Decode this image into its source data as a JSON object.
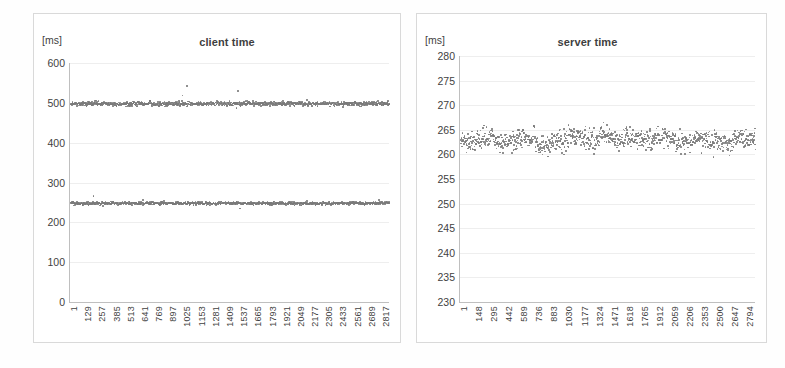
{
  "page": {
    "background": "#fefefe",
    "marker_color": "#808080",
    "gridline_color": "#eeeeee",
    "axis_color": "#bfbfbf",
    "panel_border_color": "#d9d9d9"
  },
  "chart_data": [
    {
      "type": "scatter",
      "name": "client-time-chart",
      "title": "client time",
      "ylabel": "[ms]",
      "xlabel": "",
      "ylim": [
        0,
        600
      ],
      "yticks": [
        0,
        100,
        200,
        300,
        400,
        500,
        600
      ],
      "xlim": [
        1,
        2880
      ],
      "xticks": [
        1,
        129,
        257,
        385,
        513,
        641,
        769,
        897,
        1025,
        1153,
        1281,
        1409,
        1537,
        1665,
        1793,
        1921,
        2049,
        2177,
        2305,
        2433,
        2561,
        2689,
        2817
      ],
      "grid": true,
      "legend": "none",
      "series": [
        {
          "name": "upper-band",
          "mean": 500,
          "noise": 6,
          "outlier_fraction": 0.012,
          "outlier_spread": 22,
          "n": 2880
        },
        {
          "name": "lower-band",
          "mean": 250,
          "noise": 4,
          "outlier_fraction": 0.008,
          "outlier_spread": 16,
          "n": 2880
        }
      ]
    },
    {
      "type": "scatter",
      "name": "server-time-chart",
      "title": "server time",
      "ylabel": "[ms]",
      "xlabel": "",
      "ylim": [
        230,
        280
      ],
      "yticks": [
        230,
        235,
        240,
        245,
        250,
        255,
        260,
        265,
        270,
        275,
        280
      ],
      "xlim": [
        1,
        2880
      ],
      "xticks": [
        1,
        148,
        295,
        442,
        589,
        736,
        883,
        1030,
        1177,
        1324,
        1471,
        1618,
        1765,
        1912,
        2059,
        2206,
        2353,
        2500,
        2647,
        2794
      ],
      "grid": true,
      "legend": "none",
      "series": [
        {
          "name": "server-band",
          "mean": 263.2,
          "noise": 2.2,
          "outlier_fraction": 0.004,
          "outlier_spread": 6,
          "n": 2880
        }
      ]
    }
  ]
}
